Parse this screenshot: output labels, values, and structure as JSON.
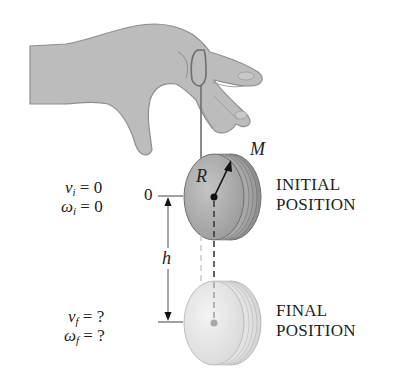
{
  "figure": {
    "type": "physics-diagram"
  },
  "labels": {
    "mass": "M",
    "radius": "R",
    "height": "h",
    "zero_mark": "0",
    "initial": {
      "v_symbol": "v",
      "v_sub": "i",
      "v_value": "0",
      "w_symbol": "ω",
      "w_sub": "i",
      "w_value": "0",
      "position_line1": "INITIAL",
      "position_line2": "POSITION"
    },
    "final": {
      "v_symbol": "v",
      "v_sub": "f",
      "v_value": "?",
      "w_symbol": "ω",
      "w_sub": "f",
      "w_value": "?",
      "position_line1": "FINAL",
      "position_line2": "POSITION"
    },
    "equals": "="
  },
  "colors": {
    "hand": "#b9b9b9",
    "hand_outline": "#8e8e8e",
    "yoyo_initial": "#a9a9a9",
    "yoyo_final": "#e4e4e4",
    "string": "#6e6e6e",
    "text": "#222222"
  }
}
